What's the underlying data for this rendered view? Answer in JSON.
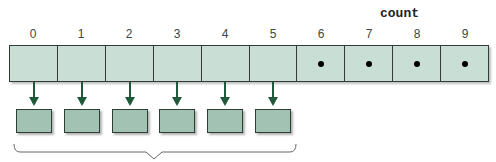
{
  "diagram": {
    "title": "count",
    "array": {
      "indices": [
        "0",
        "1",
        "2",
        "3",
        "4",
        "5",
        "6",
        "7",
        "8",
        "9"
      ],
      "cells": [
        {
          "index": 0,
          "state": "reference"
        },
        {
          "index": 1,
          "state": "reference"
        },
        {
          "index": 2,
          "state": "reference"
        },
        {
          "index": 3,
          "state": "reference"
        },
        {
          "index": 4,
          "state": "reference"
        },
        {
          "index": 5,
          "state": "reference"
        },
        {
          "index": 6,
          "state": "null"
        },
        {
          "index": 7,
          "state": "null"
        },
        {
          "index": 8,
          "state": "null"
        },
        {
          "index": 9,
          "state": "null"
        }
      ],
      "length": 10,
      "filled_count": 6
    },
    "objects": 6,
    "colors": {
      "cell_fill": "#c9dfd5",
      "object_fill": "#a2c2b4",
      "arrow": "#1f5a3a",
      "border": "#2f3d36"
    },
    "brace": "spans objects 0-5"
  }
}
